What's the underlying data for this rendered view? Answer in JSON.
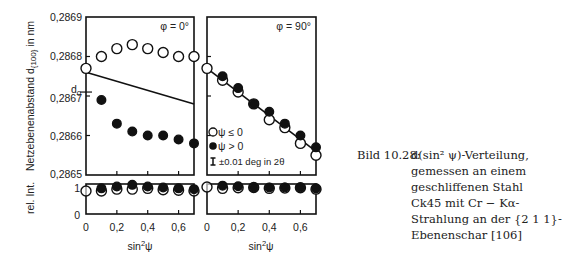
{
  "chart_data": [
    {
      "type": "scatter",
      "title": "φ = 0°",
      "xlabel": "sin²ψ",
      "ylabel": "Netzebenenabstand d{100} in nm",
      "xlim": [
        0,
        0.7
      ],
      "ylim": [
        0.2865,
        0.2869
      ],
      "yticks": [
        "0,2865",
        "0,2866",
        "0,2867",
        "0,2868",
        "0,2869"
      ],
      "xticks": [
        "0",
        "0,2",
        "0,4",
        "0,6"
      ],
      "annotation": "d0",
      "d0": 0.28671,
      "series": [
        {
          "name": "ψ ≤ 0",
          "marker": "open-circle",
          "x": [
            0,
            0.1,
            0.2,
            0.3,
            0.4,
            0.5,
            0.6,
            0.7
          ],
          "y": [
            0.28677,
            0.2868,
            0.28682,
            0.28683,
            0.28682,
            0.28681,
            0.2868,
            0.2868
          ]
        },
        {
          "name": "ψ > 0",
          "marker": "filled-circle",
          "x": [
            0.1,
            0.2,
            0.3,
            0.4,
            0.5,
            0.6,
            0.7
          ],
          "y": [
            0.28669,
            0.28663,
            0.28661,
            0.2866,
            0.2866,
            0.28659,
            0.28658
          ]
        },
        {
          "name": "fit",
          "type": "line",
          "x": [
            0,
            0.7
          ],
          "y": [
            0.28676,
            0.28668
          ]
        }
      ]
    },
    {
      "type": "scatter",
      "title": "φ = 90°",
      "xlabel": "sin²ψ",
      "xlim": [
        0,
        0.7
      ],
      "ylim": [
        0.2865,
        0.2869
      ],
      "xticks": [
        "0",
        "0,2",
        "0,4",
        "0,6"
      ],
      "legend": [
        "ψ ≤ 0",
        "ψ > 0",
        "±0.01 deg in 2θ"
      ],
      "series": [
        {
          "name": "ψ ≤ 0",
          "marker": "open-circle",
          "x": [
            0,
            0.1,
            0.2,
            0.3,
            0.4,
            0.5,
            0.6,
            0.7
          ],
          "y": [
            0.28677,
            0.28674,
            0.28671,
            0.28668,
            0.28664,
            0.28662,
            0.28658,
            0.28655
          ]
        },
        {
          "name": "ψ > 0",
          "marker": "filled-circle",
          "x": [
            0.1,
            0.2,
            0.3,
            0.4,
            0.5,
            0.6,
            0.7
          ],
          "y": [
            0.28675,
            0.28672,
            0.28668,
            0.28666,
            0.28663,
            0.2866,
            0.28657
          ]
        },
        {
          "name": "fit",
          "type": "line",
          "x": [
            0,
            0.7
          ],
          "y": [
            0.28677,
            0.28656
          ]
        }
      ]
    },
    {
      "type": "scatter",
      "title": "rel. Int. (φ = 0°)",
      "ylabel": "rel. Int.",
      "ylim": [
        0,
        1
      ],
      "yticks": [
        "0",
        "1"
      ],
      "series": [
        {
          "name": "ψ ≤ 0",
          "x": [
            0,
            0.1,
            0.2,
            0.3,
            0.4,
            0.5,
            0.6,
            0.7
          ],
          "y": [
            0.85,
            0.85,
            0.92,
            0.92,
            0.95,
            0.9,
            0.88,
            0.85
          ]
        },
        {
          "name": "ψ > 0",
          "x": [
            0.1,
            0.2,
            0.3,
            0.4,
            0.5,
            0.6,
            0.7
          ],
          "y": [
            0.95,
            1.02,
            1.08,
            1.02,
            0.98,
            0.95,
            0.92
          ]
        }
      ]
    },
    {
      "type": "scatter",
      "title": "rel. Int. (φ = 90°)",
      "ylim": [
        0,
        1
      ],
      "series": [
        {
          "name": "ψ ≤ 0",
          "x": [
            0,
            0.1,
            0.2,
            0.3,
            0.4,
            0.5,
            0.6,
            0.7
          ],
          "y": [
            1,
            0.95,
            0.97,
            0.98,
            0.95,
            0.96,
            0.97,
            0.92
          ]
        },
        {
          "name": "ψ > 0",
          "x": [
            0.1,
            0.2,
            0.3,
            0.4,
            0.5,
            0.6,
            0.7
          ],
          "y": [
            1.05,
            1.03,
            0.98,
            0.98,
            0.98,
            0.98,
            0.95
          ]
        }
      ]
    }
  ],
  "labels": {
    "ylabel": "Netzebenenabstand d",
    "ylabel_sub": "{100}",
    "ylabel_unit": " in nm",
    "ylabel_bottom": "rel. Int.",
    "xlabel": "sin",
    "xlabel_sup": "2",
    "xlabel_end": "ψ",
    "phi0": "φ = 0°",
    "phi90": "φ = 90°",
    "d0": "d",
    "d0_sub": "0",
    "legend_open": "ψ ≤ 0",
    "legend_filled": "ψ > 0",
    "legend_err": "±0.01 deg in 2θ",
    "yticks": [
      "0,2869",
      "0,2868",
      "0,2867",
      "0,2866",
      "0,2865"
    ],
    "xticks": [
      "0",
      "0,2",
      "0,4",
      "0,6"
    ],
    "int_ticks": [
      "1",
      "0"
    ]
  },
  "caption": {
    "label": "Bild 10.28:",
    "lines": [
      "d(sin² ψ)-Verteilung,",
      "gemessen an einem",
      "geschliffenen Stahl",
      "Ck45 mit Cr − Kα-",
      "Strahlung an der {2 1 1}-",
      "Ebenenschar [106]"
    ]
  }
}
